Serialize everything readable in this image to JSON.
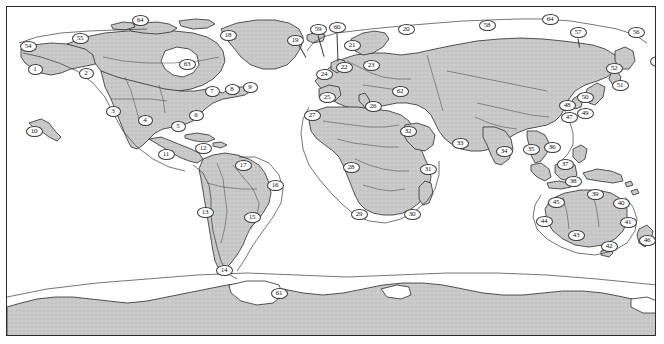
{
  "figure": {
    "kind": "world-map",
    "projection": "equirectangular",
    "title": "",
    "caption": "",
    "land_fill": "#c8c8c8",
    "ocean_fill": "#ffffff",
    "coast_stroke": "#2b2b2b",
    "border_stroke": "#3a3a3a",
    "marker_fill": "#ffffff",
    "marker_stroke": "#3a3a3a",
    "marker_text": "#111111",
    "frame_stroke": "#2b2b2b",
    "width": 664,
    "height": 344
  },
  "markers": [
    {
      "id": 1,
      "label": "1",
      "x": 28,
      "y": 62,
      "region": "alaska"
    },
    {
      "id": 2,
      "label": "2",
      "x": 79,
      "y": 66,
      "region": "northwest-pacific-coast"
    },
    {
      "id": 3,
      "label": "3",
      "x": 106,
      "y": 104,
      "region": "baja-pacific"
    },
    {
      "id": 4,
      "label": "4",
      "x": 138,
      "y": 113,
      "region": "gulf-of-california"
    },
    {
      "id": 5,
      "label": "5",
      "x": 171,
      "y": 119,
      "region": "mexico-gulf"
    },
    {
      "id": 6,
      "label": "6",
      "x": 189,
      "y": 108,
      "region": "florida"
    },
    {
      "id": 7,
      "label": "7",
      "x": 205,
      "y": 84,
      "region": "mid-atlantic-us"
    },
    {
      "id": 8,
      "label": "8",
      "x": 225,
      "y": 82,
      "region": "northeast-us"
    },
    {
      "id": 9,
      "label": "9",
      "x": 243,
      "y": 80,
      "region": "maritimes"
    },
    {
      "id": 10,
      "label": "10",
      "x": 27,
      "y": 124,
      "region": "hawaii"
    },
    {
      "id": 11,
      "label": "11",
      "x": 159,
      "y": 147,
      "region": "central-america-pacific"
    },
    {
      "id": 12,
      "label": "12",
      "x": 196,
      "y": 141,
      "region": "caribbean"
    },
    {
      "id": 13,
      "label": "13",
      "x": 198,
      "y": 205,
      "region": "peru-chile-coast"
    },
    {
      "id": 14,
      "label": "14",
      "x": 217,
      "y": 263,
      "region": "patagonia"
    },
    {
      "id": 15,
      "label": "15",
      "x": 245,
      "y": 210,
      "region": "south-brazil"
    },
    {
      "id": 16,
      "label": "16",
      "x": 268,
      "y": 178,
      "region": "brazil-east-coast"
    },
    {
      "id": 17,
      "label": "17",
      "x": 236,
      "y": 158,
      "region": "northern-south-america"
    },
    {
      "id": 18,
      "label": "18",
      "x": 221,
      "y": 28,
      "region": "west-greenland"
    },
    {
      "id": 19,
      "label": "19",
      "x": 288,
      "y": 33,
      "region": "east-greenland"
    },
    {
      "id": 20,
      "label": "20",
      "x": 399,
      "y": 22,
      "region": "barents-sea"
    },
    {
      "id": 21,
      "label": "21",
      "x": 345,
      "y": 38,
      "region": "norwegian-sea"
    },
    {
      "id": 22,
      "label": "22",
      "x": 337,
      "y": 60,
      "region": "north-sea"
    },
    {
      "id": 23,
      "label": "23",
      "x": 364,
      "y": 58,
      "region": "baltic"
    },
    {
      "id": 24,
      "label": "24",
      "x": 317,
      "y": 67,
      "region": "bay-of-biscay"
    },
    {
      "id": 25,
      "label": "25",
      "x": 320,
      "y": 90,
      "region": "iberia-atlantic"
    },
    {
      "id": 26,
      "label": "26",
      "x": 366,
      "y": 99,
      "region": "mediterranean"
    },
    {
      "id": 27,
      "label": "27",
      "x": 305,
      "y": 108,
      "region": "northwest-africa"
    },
    {
      "id": 28,
      "label": "28",
      "x": 344,
      "y": 160,
      "region": "gulf-of-guinea"
    },
    {
      "id": 29,
      "label": "29",
      "x": 352,
      "y": 207,
      "region": "southwest-africa"
    },
    {
      "id": 30,
      "label": "30",
      "x": 405,
      "y": 207,
      "region": "southeast-africa"
    },
    {
      "id": 31,
      "label": "31",
      "x": 421,
      "y": 162,
      "region": "east-africa"
    },
    {
      "id": 32,
      "label": "32",
      "x": 401,
      "y": 124,
      "region": "red-sea"
    },
    {
      "id": 33,
      "label": "33",
      "x": 453,
      "y": 136,
      "region": "arabian-sea"
    },
    {
      "id": 34,
      "label": "34",
      "x": 497,
      "y": 144,
      "region": "bay-of-bengal"
    },
    {
      "id": 35,
      "label": "35",
      "x": 524,
      "y": 142,
      "region": "andaman"
    },
    {
      "id": 36,
      "label": "36",
      "x": 545,
      "y": 140,
      "region": "south-china-sea"
    },
    {
      "id": 37,
      "label": "37",
      "x": 558,
      "y": 157,
      "region": "philippines"
    },
    {
      "id": 38,
      "label": "38",
      "x": 566,
      "y": 174,
      "region": "indonesia"
    },
    {
      "id": 39,
      "label": "39",
      "x": 588,
      "y": 187,
      "region": "arafura-sea"
    },
    {
      "id": 40,
      "label": "40",
      "x": 614,
      "y": 196,
      "region": "coral-sea"
    },
    {
      "id": 41,
      "label": "41",
      "x": 621,
      "y": 215,
      "region": "east-australia"
    },
    {
      "id": 42,
      "label": "42",
      "x": 602,
      "y": 239,
      "region": "southeast-australia"
    },
    {
      "id": 43,
      "label": "43",
      "x": 569,
      "y": 228,
      "region": "great-australian-bight"
    },
    {
      "id": 44,
      "label": "44",
      "x": 537,
      "y": 214,
      "region": "west-australia"
    },
    {
      "id": 45,
      "label": "45",
      "x": 549,
      "y": 195,
      "region": "northwest-australia"
    },
    {
      "id": 46,
      "label": "46",
      "x": 640,
      "y": 233,
      "region": "new-zealand"
    },
    {
      "id": 47,
      "label": "47",
      "x": 562,
      "y": 110,
      "region": "east-china-sea"
    },
    {
      "id": 48,
      "label": "48",
      "x": 560,
      "y": 98,
      "region": "yellow-sea"
    },
    {
      "id": 49,
      "label": "49",
      "x": 578,
      "y": 106,
      "region": "japan-south"
    },
    {
      "id": 50,
      "label": "50",
      "x": 578,
      "y": 90,
      "region": "sea-of-japan"
    },
    {
      "id": 51,
      "label": "51",
      "x": 613,
      "y": 78,
      "region": "sakhalin"
    },
    {
      "id": 52,
      "label": "52",
      "x": 607,
      "y": 61,
      "region": "sea-of-okhotsk"
    },
    {
      "id": 53,
      "label": "53",
      "x": 651,
      "y": 54,
      "region": "kamchatka-pacific"
    },
    {
      "id": 54,
      "label": "54",
      "x": 21,
      "y": 39,
      "region": "bering-sea"
    },
    {
      "id": 55,
      "label": "55",
      "x": 73,
      "y": 31,
      "region": "beaufort-sea"
    },
    {
      "id": 56,
      "label": "56",
      "x": 629,
      "y": 25,
      "region": "bering-strait-east"
    },
    {
      "id": 57,
      "label": "57",
      "x": 571,
      "y": 25,
      "region": "east-siberian-sea"
    },
    {
      "id": 58,
      "label": "58",
      "x": 480,
      "y": 18,
      "region": "kara-sea"
    },
    {
      "id": 59,
      "label": "59",
      "x": 311,
      "y": 22,
      "region": "iceland"
    },
    {
      "id": 60,
      "label": "60",
      "x": 330,
      "y": 20,
      "region": "faroe-shelf"
    },
    {
      "id": 61,
      "label": "61",
      "x": 272,
      "y": 286,
      "region": "southern-ocean"
    },
    {
      "id": 62,
      "label": "62",
      "x": 393,
      "y": 84,
      "region": "black-sea-caspian"
    },
    {
      "id": 63,
      "label": "63",
      "x": 180,
      "y": 57,
      "region": "hudson-bay"
    },
    {
      "id": 64,
      "label": "64",
      "x": 133,
      "y": 13,
      "region": "arctic-archipelago"
    },
    {
      "id": 65,
      "label": "64",
      "x": 543,
      "y": 12,
      "region": "arctic-ocean-east"
    }
  ],
  "leaders": [
    {
      "name": "leader-59",
      "x": 311,
      "y": 28,
      "length": 22,
      "angle": 74
    },
    {
      "name": "leader-60",
      "x": 330,
      "y": 26,
      "length": 28,
      "angle": 88
    },
    {
      "name": "leader-19",
      "x": 292,
      "y": 38,
      "length": 14,
      "angle": 60
    },
    {
      "name": "leader-57",
      "x": 571,
      "y": 31,
      "length": 9,
      "angle": 80
    }
  ]
}
